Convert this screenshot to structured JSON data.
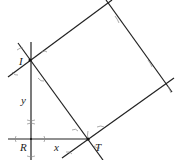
{
  "diagram": {
    "type": "compass-and-straightedge construction",
    "points": {
      "I": {
        "label": "I",
        "x": 30,
        "y": 60
      },
      "R": {
        "label": "R",
        "x": 31,
        "y": 139
      },
      "T": {
        "label": "T",
        "x": 88,
        "y": 139
      }
    },
    "segment_labels": {
      "vertical": "y",
      "horizontal": "x"
    },
    "colors": {
      "line": "#222222",
      "arc": "#888888",
      "background": "#ffffff"
    }
  }
}
